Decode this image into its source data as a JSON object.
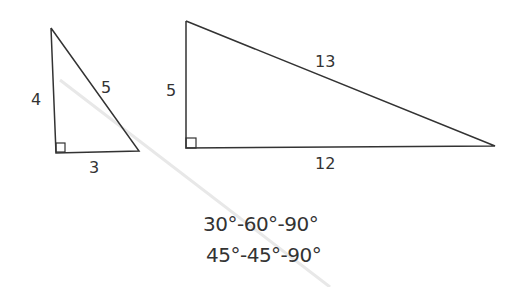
{
  "diagram": {
    "triangles": [
      {
        "name": "3-4-5 triangle",
        "sides": {
          "vertical": "4",
          "hypotenuse": "5",
          "base": "3"
        },
        "right_angle": true
      },
      {
        "name": "5-12-13 triangle",
        "sides": {
          "vertical": "5",
          "hypotenuse": "13",
          "base": "12"
        },
        "right_angle": true
      }
    ],
    "special_triangles": [
      "30°-60°-90°",
      "45°-45°-90°"
    ],
    "colors": {
      "stroke": "#333333",
      "background": "#ffffff",
      "crease": "#e6e6e6"
    }
  }
}
